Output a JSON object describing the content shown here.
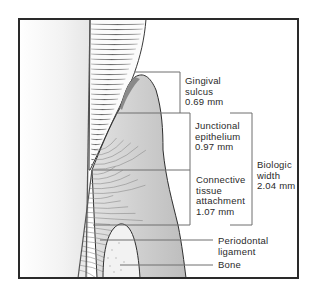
{
  "labels": {
    "sulcus": {
      "lines": [
        "Gingival",
        "sulcus",
        "0.69 mm"
      ]
    },
    "junctional": {
      "lines": [
        "Junctional",
        "epithelium",
        "0.97 mm"
      ]
    },
    "connective": {
      "lines": [
        "Connective",
        "tissue",
        "attachment",
        "1.07 mm"
      ]
    },
    "biologic": {
      "lines": [
        "Biologic",
        "width",
        "2.04 mm"
      ]
    },
    "pdl": {
      "lines": [
        "Periodontal",
        "ligament"
      ]
    },
    "bone": {
      "lines": [
        "Bone"
      ]
    }
  },
  "colors": {
    "frame": "#2a2a2a",
    "tooth": "#f4f4f4",
    "enamel_lines": "#9a9a9a",
    "gingiva": "#c9c9c9",
    "gingiva_dark": "#a8a8a8",
    "bone": "#f2f2f2",
    "leader": "#7a7a7a"
  }
}
